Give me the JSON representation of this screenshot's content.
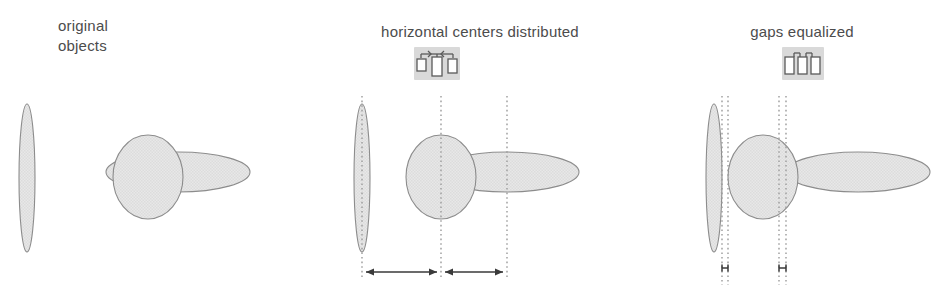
{
  "figure": {
    "background_color": "#ffffff",
    "shape_fill": "#e4e4e4",
    "shape_stroke": "#8c8c8c",
    "guide_color": "#9a9a9a",
    "arrow_color": "#3a3a3a",
    "text_color": "#4c4c4c",
    "icon_chip_color": "#d9d9d9",
    "icon_stroke_color": "#5a5a5a"
  },
  "panels": [
    {
      "id": "original",
      "caption": "original\nobjects",
      "icon": null,
      "shapes": [
        {
          "name": "tall-narrow-ellipse",
          "cx": 27,
          "cy": 178,
          "rx": 8,
          "ry": 74,
          "rotation": 0
        },
        {
          "name": "circle-ellipse",
          "cx": 148,
          "cy": 177,
          "rx": 35,
          "ry": 42,
          "rotation": 0
        },
        {
          "name": "wide-flat-ellipse",
          "cx": 178,
          "cy": 172,
          "rx": 72,
          "ry": 20,
          "rotation": 0
        }
      ],
      "guides": [],
      "measures": []
    },
    {
      "id": "centers",
      "caption": "horizontal centers distributed",
      "icon": "distribute-horizontal-centers-icon",
      "shapes": [
        {
          "name": "tall-narrow-ellipse",
          "cx": 62,
          "cy": 178,
          "rx": 8,
          "ry": 74,
          "rotation": 0
        },
        {
          "name": "circle-ellipse",
          "cx": 141,
          "cy": 177,
          "rx": 35,
          "ry": 42,
          "rotation": 0
        },
        {
          "name": "wide-flat-ellipse",
          "cx": 207,
          "cy": 172,
          "rx": 72,
          "ry": 20,
          "rotation": 0
        }
      ],
      "guides": [
        62,
        141,
        207
      ],
      "measures": [
        {
          "from": 62,
          "to": 141,
          "y": 272,
          "double_headed": true
        },
        {
          "from": 141,
          "to": 207,
          "y": 272,
          "double_headed": true
        }
      ]
    },
    {
      "id": "gaps",
      "caption": "gaps equalized",
      "icon": "equalize-gaps-icon",
      "shapes": [
        {
          "name": "tall-narrow-ellipse",
          "cx": 54,
          "cy": 178,
          "rx": 8,
          "ry": 74,
          "rotation": 0
        },
        {
          "name": "circle-ellipse",
          "cx": 103,
          "cy": 177,
          "rx": 35,
          "ry": 42,
          "rotation": 0
        },
        {
          "name": "wide-flat-ellipse",
          "cx": 198,
          "cy": 172,
          "rx": 72,
          "ry": 20,
          "rotation": 0
        }
      ],
      "guides": [
        62,
        68,
        119,
        126
      ],
      "measures": [
        {
          "from": 62,
          "to": 68,
          "y": 272,
          "double_headed": true
        },
        {
          "from": 119,
          "to": 126,
          "y": 272,
          "double_headed": true
        }
      ]
    }
  ]
}
